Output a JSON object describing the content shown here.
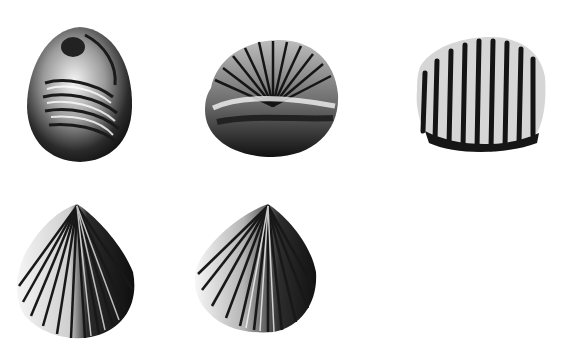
{
  "plate": {
    "background": "#ffffff",
    "ink": "#111111",
    "specimens": [
      {
        "id": "shell-1",
        "view": "oval-umbonal",
        "x": 25,
        "y": 25,
        "w": 110,
        "h": 138
      },
      {
        "id": "shell-2",
        "view": "rounded-anterior",
        "x": 203,
        "y": 38,
        "w": 137,
        "h": 120
      },
      {
        "id": "shell-3",
        "view": "ribbed-lateral",
        "x": 415,
        "y": 35,
        "w": 132,
        "h": 118
      },
      {
        "id": "shell-4",
        "view": "fan-dorsal",
        "x": 13,
        "y": 202,
        "w": 124,
        "h": 138
      },
      {
        "id": "shell-5",
        "view": "fan-ventral",
        "x": 190,
        "y": 202,
        "w": 128,
        "h": 131
      }
    ]
  }
}
